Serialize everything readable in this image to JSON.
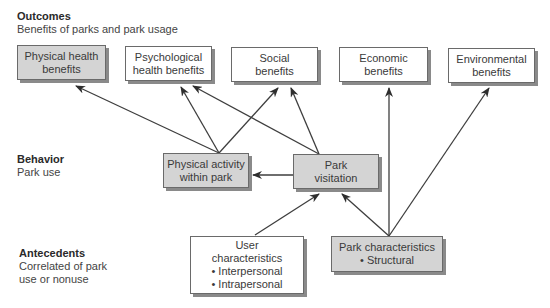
{
  "levels": {
    "outcomes": {
      "title": "Outcomes",
      "subtitle": "Benefits of parks and park usage"
    },
    "behavior": {
      "title": "Behavior",
      "subtitle": "Park use"
    },
    "antecedents": {
      "title": "Antecedents",
      "subtitle_line1": "Correlated of park",
      "subtitle_line2": "use or nonuse"
    }
  },
  "nodes": {
    "physical_health": {
      "line1": "Physical health",
      "line2": "benefits",
      "fill": "#d4d4d4"
    },
    "psychological_health": {
      "line1": "Psychological",
      "line2": "health benefits",
      "fill": "#ffffff"
    },
    "social": {
      "line1": "Social",
      "line2": "benefits",
      "fill": "#ffffff"
    },
    "economic": {
      "line1": "Economic",
      "line2": "benefits",
      "fill": "#ffffff"
    },
    "environmental": {
      "line1": "Environmental",
      "line2": "benefits",
      "fill": "#ffffff"
    },
    "physical_activity": {
      "line1": "Physical activity",
      "line2": "within park",
      "fill": "#d4d4d4"
    },
    "park_visitation": {
      "line1": "Park",
      "line2": "visitation",
      "fill": "#d4d4d4"
    },
    "user_characteristics": {
      "line1": "User",
      "line2": "characteristics",
      "bullet1": "• Interpersonal",
      "bullet2": "• Intrapersonal",
      "fill": "#ffffff"
    },
    "park_characteristics": {
      "line1": "Park characteristics",
      "bullet1": "• Structural",
      "fill": "#d4d4d4"
    }
  },
  "edges": [
    {
      "from": "physical_activity",
      "to": "physical_health"
    },
    {
      "from": "physical_activity",
      "to": "psychological_health"
    },
    {
      "from": "physical_activity",
      "to": "social"
    },
    {
      "from": "park_visitation",
      "to": "psychological_health"
    },
    {
      "from": "park_visitation",
      "to": "social"
    },
    {
      "from": "park_visitation",
      "to": "physical_activity"
    },
    {
      "from": "user_characteristics",
      "to": "park_visitation"
    },
    {
      "from": "park_characteristics",
      "to": "park_visitation"
    },
    {
      "from": "park_characteristics",
      "to": "economic"
    },
    {
      "from": "park_characteristics",
      "to": "environmental"
    }
  ],
  "colors": {
    "gray_fill": "#d4d4d4",
    "line": "#3a3a3a",
    "border": "#6a6a6a"
  }
}
